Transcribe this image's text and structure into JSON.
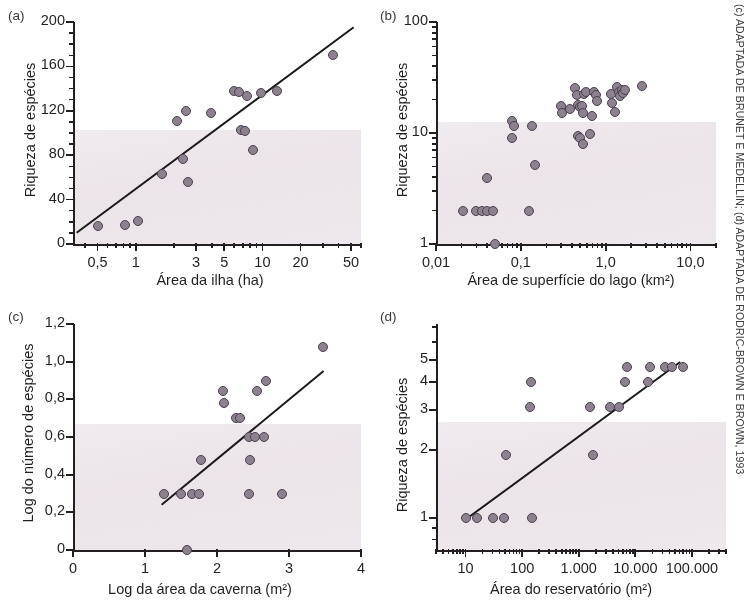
{
  "credit": "(c) ADAPTADA DE BRUNET E MEDELLIN; (d) ADAPTADA DE RODRIC-BROWN E BROWN, 1993",
  "panels": {
    "a": {
      "tag": "(a)",
      "ylabel": "Riqueza de espécies",
      "xlabel": "Área da ilha (ha)",
      "yticks": [
        "0",
        "40",
        "80",
        "120",
        "160",
        "200"
      ],
      "xticks": [
        "0,5",
        "1",
        "3",
        "5",
        "10",
        "20",
        "50"
      ]
    },
    "b": {
      "tag": "(b)",
      "ylabel": "Riqueza de espécies",
      "xlabel": "Área de superfície do lago (km²)",
      "yticks": [
        "1",
        "10",
        "100"
      ],
      "xticks": [
        "0,01",
        "0,1",
        "1,0",
        "10,0"
      ]
    },
    "c": {
      "tag": "(c)",
      "ylabel": "Log do número de espécies",
      "xlabel": "Log da área da caverna (m²)",
      "yticks": [
        "0",
        "0,2",
        "0,4",
        "0,6",
        "0,8",
        "1,0",
        "1,2"
      ],
      "xticks": [
        "0",
        "1",
        "2",
        "3",
        "4"
      ]
    },
    "d": {
      "tag": "(d)",
      "ylabel": "Riqueza de espécies",
      "xlabel": "Área do reservatório (m²)",
      "yticks": [
        "1",
        "2",
        "3",
        "4",
        "5"
      ],
      "xticks": [
        "10",
        "100",
        "1.000",
        "10.000",
        "100.000"
      ]
    }
  },
  "chart_data": [
    {
      "panel": "a",
      "type": "scatter",
      "title": "(a)",
      "xlabel": "Área da ilha (ha)",
      "ylabel": "Riqueza de espécies",
      "xscale": "log",
      "yscale": "linear",
      "xlim": [
        0.32,
        60
      ],
      "ylim": [
        0,
        200
      ],
      "xticks": [
        0.5,
        1,
        3,
        5,
        10,
        20,
        50
      ],
      "xticklabels": [
        "0,5",
        "1",
        "3",
        "5",
        "10",
        "20",
        "50"
      ],
      "yticks": [
        0,
        40,
        80,
        120,
        160,
        200
      ],
      "yticklabels": [
        "0",
        "40",
        "80",
        "120",
        "160",
        "200"
      ],
      "y_minor_tick_step": 10,
      "grid": false,
      "legend": null,
      "points": [
        {
          "x": 0.5,
          "y": 16
        },
        {
          "x": 0.82,
          "y": 17
        },
        {
          "x": 1.05,
          "y": 21
        },
        {
          "x": 1.6,
          "y": 63
        },
        {
          "x": 2.1,
          "y": 111
        },
        {
          "x": 2.35,
          "y": 77
        },
        {
          "x": 2.5,
          "y": 120
        },
        {
          "x": 2.6,
          "y": 56
        },
        {
          "x": 3.9,
          "y": 118
        },
        {
          "x": 6.0,
          "y": 138
        },
        {
          "x": 6.5,
          "y": 137
        },
        {
          "x": 6.8,
          "y": 103
        },
        {
          "x": 7.3,
          "y": 102
        },
        {
          "x": 7.5,
          "y": 133
        },
        {
          "x": 8.4,
          "y": 85
        },
        {
          "x": 9.8,
          "y": 136
        },
        {
          "x": 13.0,
          "y": 138
        },
        {
          "x": 36.0,
          "y": 170
        }
      ],
      "trendline": {
        "x1": 0.34,
        "y1": 11,
        "x2": 52.0,
        "y2": 196
      }
    },
    {
      "panel": "b",
      "type": "scatter",
      "title": "(b)",
      "xlabel": "Área de superfície do lago (km²)",
      "ylabel": "Riqueza de espécies",
      "xscale": "log",
      "yscale": "log",
      "xlim": [
        0.01,
        20
      ],
      "ylim": [
        1,
        100
      ],
      "xticks": [
        0.01,
        0.1,
        1.0,
        10.0
      ],
      "xticklabels": [
        "0,01",
        "0,1",
        "1,0",
        "10,0"
      ],
      "yticks": [
        1,
        10,
        100
      ],
      "yticklabels": [
        "1",
        "10",
        "100"
      ],
      "grid": false,
      "legend": null,
      "points": [
        {
          "x": 0.021,
          "y": 2.0
        },
        {
          "x": 0.03,
          "y": 2.0
        },
        {
          "x": 0.035,
          "y": 2.0
        },
        {
          "x": 0.04,
          "y": 2.0
        },
        {
          "x": 0.047,
          "y": 2.0
        },
        {
          "x": 0.049,
          "y": 1.0
        },
        {
          "x": 0.04,
          "y": 3.9
        },
        {
          "x": 0.079,
          "y": 12.8
        },
        {
          "x": 0.083,
          "y": 11.6
        },
        {
          "x": 0.078,
          "y": 9.0
        },
        {
          "x": 0.125,
          "y": 2.0
        },
        {
          "x": 0.135,
          "y": 11.6
        },
        {
          "x": 0.147,
          "y": 5.1
        },
        {
          "x": 0.3,
          "y": 17.5
        },
        {
          "x": 0.305,
          "y": 15.0
        },
        {
          "x": 0.38,
          "y": 16.5
        },
        {
          "x": 0.43,
          "y": 25.5
        },
        {
          "x": 0.455,
          "y": 22.0
        },
        {
          "x": 0.47,
          "y": 18.0
        },
        {
          "x": 0.5,
          "y": 17.0
        },
        {
          "x": 0.52,
          "y": 17.5
        },
        {
          "x": 0.545,
          "y": 15.0
        },
        {
          "x": 0.56,
          "y": 22.5
        },
        {
          "x": 0.585,
          "y": 23.5
        },
        {
          "x": 0.47,
          "y": 9.3
        },
        {
          "x": 0.505,
          "y": 9.1
        },
        {
          "x": 0.545,
          "y": 7.9
        },
        {
          "x": 0.66,
          "y": 9.8
        },
        {
          "x": 0.69,
          "y": 14.2
        },
        {
          "x": 0.73,
          "y": 23.5
        },
        {
          "x": 0.76,
          "y": 22.0
        },
        {
          "x": 0.79,
          "y": 19.5
        },
        {
          "x": 1.15,
          "y": 22.5
        },
        {
          "x": 1.2,
          "y": 18.5
        },
        {
          "x": 1.28,
          "y": 15.5
        },
        {
          "x": 1.35,
          "y": 26.0
        },
        {
          "x": 1.42,
          "y": 23.5
        },
        {
          "x": 1.48,
          "y": 21.5
        },
        {
          "x": 1.56,
          "y": 24.5
        },
        {
          "x": 1.62,
          "y": 23.0
        },
        {
          "x": 1.7,
          "y": 24.5
        },
        {
          "x": 2.7,
          "y": 26.5
        }
      ],
      "trendline": null
    },
    {
      "panel": "c",
      "type": "scatter",
      "title": "(c)",
      "xlabel": "Log da área da caverna (m²)",
      "ylabel": "Log do número de espécies",
      "xscale": "linear",
      "yscale": "linear",
      "xlim": [
        0,
        4
      ],
      "ylim": [
        0,
        1.2
      ],
      "xticks": [
        0,
        1,
        2,
        3,
        4
      ],
      "xticklabels": [
        "0",
        "1",
        "2",
        "3",
        "4"
      ],
      "yticks": [
        0,
        0.2,
        0.4,
        0.6,
        0.8,
        1.0,
        1.2
      ],
      "yticklabels": [
        "0",
        "0,2",
        "0,4",
        "0,6",
        "0,8",
        "1,0",
        "1,2"
      ],
      "grid": false,
      "legend": null,
      "points": [
        {
          "x": 1.27,
          "y": 0.3
        },
        {
          "x": 1.5,
          "y": 0.3
        },
        {
          "x": 1.58,
          "y": 0.0
        },
        {
          "x": 1.65,
          "y": 0.3
        },
        {
          "x": 1.75,
          "y": 0.3
        },
        {
          "x": 1.78,
          "y": 0.48
        },
        {
          "x": 2.08,
          "y": 0.845
        },
        {
          "x": 2.1,
          "y": 0.78
        },
        {
          "x": 2.27,
          "y": 0.7
        },
        {
          "x": 2.32,
          "y": 0.7
        },
        {
          "x": 2.45,
          "y": 0.6
        },
        {
          "x": 2.45,
          "y": 0.3
        },
        {
          "x": 2.46,
          "y": 0.48
        },
        {
          "x": 2.53,
          "y": 0.6
        },
        {
          "x": 2.55,
          "y": 0.845
        },
        {
          "x": 2.65,
          "y": 0.6
        },
        {
          "x": 2.68,
          "y": 0.9
        },
        {
          "x": 2.9,
          "y": 0.3
        },
        {
          "x": 3.47,
          "y": 1.08
        }
      ],
      "trendline": {
        "x1": 1.22,
        "y1": 0.245,
        "x2": 3.47,
        "y2": 0.955
      }
    },
    {
      "panel": "d",
      "type": "scatter",
      "title": "(d)",
      "xlabel": "Área do reservatório (m²)",
      "ylabel": "Riqueza de espécies",
      "xscale": "log",
      "yscale": "log",
      "xlim": [
        3,
        400000
      ],
      "ylim": [
        0.72,
        7.2
      ],
      "xticks": [
        10,
        100,
        1000,
        10000,
        100000
      ],
      "xticklabels": [
        "10",
        "100",
        "1.000",
        "10.000",
        "100.000"
      ],
      "yticks": [
        1,
        2,
        3,
        4,
        5
      ],
      "yticklabels": [
        "1",
        "2",
        "3",
        "4",
        "5"
      ],
      "grid": false,
      "legend": null,
      "points": [
        {
          "x": 10,
          "y": 1.0
        },
        {
          "x": 16,
          "y": 1.0
        },
        {
          "x": 30,
          "y": 1.0
        },
        {
          "x": 48,
          "y": 1.0
        },
        {
          "x": 52,
          "y": 1.9
        },
        {
          "x": 150,
          "y": 1.0
        },
        {
          "x": 140,
          "y": 3.1
        },
        {
          "x": 145,
          "y": 4.0
        },
        {
          "x": 1600,
          "y": 3.1
        },
        {
          "x": 1750,
          "y": 1.9
        },
        {
          "x": 3500,
          "y": 3.1
        },
        {
          "x": 5200,
          "y": 3.1
        },
        {
          "x": 6500,
          "y": 4.0
        },
        {
          "x": 7000,
          "y": 4.65
        },
        {
          "x": 17000,
          "y": 4.0
        },
        {
          "x": 18000,
          "y": 4.65
        },
        {
          "x": 33000,
          "y": 4.65
        },
        {
          "x": 45000,
          "y": 4.65
        },
        {
          "x": 70000,
          "y": 4.65
        }
      ],
      "trendline": {
        "x1": 10,
        "y1": 1.0,
        "x2": 60000,
        "y2": 4.95
      }
    }
  ]
}
